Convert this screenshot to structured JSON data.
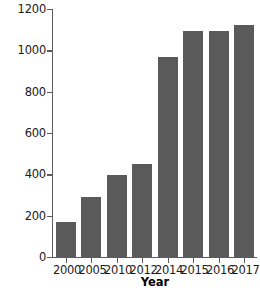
{
  "chart_data": {
    "type": "bar",
    "title": "",
    "subtitle": "",
    "xlabel": "Year",
    "ylabel": "GDP US$ billion",
    "categories": [
      "2000",
      "2005",
      "2010",
      "2012",
      "2014",
      "2015",
      "2016",
      "2017"
    ],
    "values": [
      170,
      290,
      395,
      450,
      970,
      1095,
      1095,
      1125
    ],
    "series": [
      {
        "name": "GDP US$ billion",
        "values": [
          170,
          290,
          395,
          450,
          970,
          1095,
          1095,
          1125
        ]
      }
    ],
    "ylim": [
      0,
      1200
    ],
    "yticks": [
      0,
      200,
      400,
      600,
      800,
      1000,
      1200
    ],
    "ytick_labels": [
      "0",
      "200",
      "400",
      "600",
      "800",
      "1000",
      "1200"
    ],
    "grid": false,
    "legend": false,
    "legend_position": "none",
    "bar_color": "#5a5a5a",
    "axis_color": "#5c5c5c",
    "background_color": "#ffffff",
    "text_color": "#1a1a1a"
  }
}
